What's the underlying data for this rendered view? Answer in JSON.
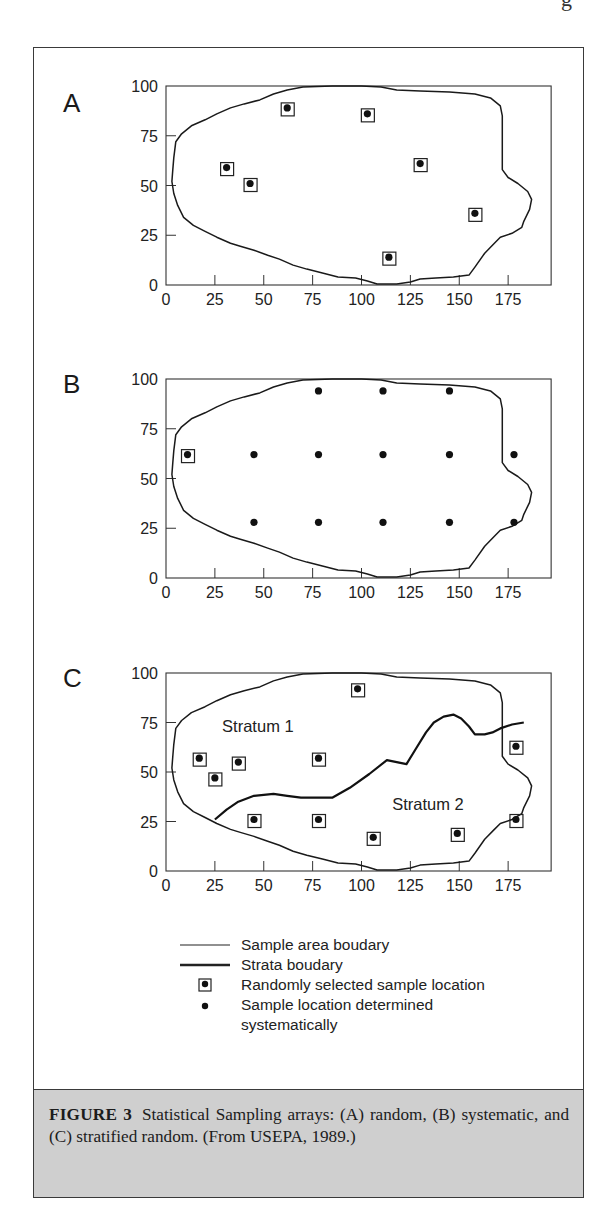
{
  "page": {
    "header_fragment": "g"
  },
  "figure": {
    "caption": {
      "label": "FIGURE 3",
      "text": "Statistical Sampling arrays: (A) random, (B) systematic, and (C) stratified random. (From USEPA, 1989.)"
    },
    "legend": [
      {
        "symbol": "thin-line",
        "label": "Sample area boudary"
      },
      {
        "symbol": "thick-line",
        "label": "Strata boudary"
      },
      {
        "symbol": "boxed-dot",
        "label": "Randomly selected sample location"
      },
      {
        "symbol": "dot",
        "label": "Sample location determined systematically"
      }
    ]
  },
  "chart_data": [
    {
      "type": "scatter",
      "panel_label": "A",
      "title": "Random sampling",
      "xlim": [
        0,
        197
      ],
      "ylim": [
        0,
        100
      ],
      "xticks": [
        0,
        25,
        50,
        75,
        100,
        125,
        150,
        175
      ],
      "yticks": [
        0,
        25,
        50,
        75,
        100
      ],
      "grid": false,
      "random_samples": [
        [
          31,
          59
        ],
        [
          43,
          51
        ],
        [
          62,
          89
        ],
        [
          103,
          86
        ],
        [
          130,
          61
        ],
        [
          158,
          36
        ],
        [
          114,
          14
        ]
      ],
      "systematic_samples": []
    },
    {
      "type": "scatter",
      "panel_label": "B",
      "title": "Systematic sampling",
      "xlim": [
        0,
        197
      ],
      "ylim": [
        0,
        100
      ],
      "xticks": [
        0,
        25,
        50,
        75,
        100,
        125,
        150,
        175
      ],
      "yticks": [
        0,
        25,
        50,
        75,
        100
      ],
      "grid": false,
      "random_samples": [
        [
          11,
          62
        ]
      ],
      "systematic_samples": [
        [
          78,
          94
        ],
        [
          111,
          94
        ],
        [
          145,
          94
        ],
        [
          11,
          62
        ],
        [
          45,
          62
        ],
        [
          78,
          62
        ],
        [
          111,
          62
        ],
        [
          145,
          62
        ],
        [
          178,
          62
        ],
        [
          45,
          28
        ],
        [
          78,
          28
        ],
        [
          111,
          28
        ],
        [
          145,
          28
        ],
        [
          178,
          28
        ]
      ]
    },
    {
      "type": "scatter",
      "panel_label": "C",
      "title": "Stratified random sampling",
      "xlim": [
        0,
        197
      ],
      "ylim": [
        0,
        100
      ],
      "xticks": [
        0,
        25,
        50,
        75,
        100,
        125,
        150,
        175
      ],
      "yticks": [
        0,
        25,
        50,
        75,
        100
      ],
      "grid": false,
      "annotations": [
        {
          "text": "Stratum 1",
          "x": 47,
          "y": 70
        },
        {
          "text": "Stratum 2",
          "x": 134,
          "y": 31
        }
      ],
      "random_samples": [
        [
          17,
          57
        ],
        [
          25,
          47
        ],
        [
          37,
          55
        ],
        [
          78,
          57
        ],
        [
          98,
          92
        ],
        [
          179,
          63
        ],
        [
          45,
          26
        ],
        [
          78,
          26
        ],
        [
          106,
          17
        ],
        [
          149,
          19
        ],
        [
          179,
          26
        ]
      ],
      "systematic_samples": [],
      "strata_boundary": [
        [
          25,
          26
        ],
        [
          31,
          31
        ],
        [
          37,
          35
        ],
        [
          45,
          38
        ],
        [
          55,
          39
        ],
        [
          62,
          38
        ],
        [
          69,
          37
        ],
        [
          85,
          37
        ],
        [
          94,
          42
        ],
        [
          104,
          49
        ],
        [
          113,
          56
        ],
        [
          118,
          55
        ],
        [
          123,
          54
        ],
        [
          128,
          62
        ],
        [
          133,
          70
        ],
        [
          137,
          75
        ],
        [
          142,
          78
        ],
        [
          147,
          79
        ],
        [
          151,
          77
        ],
        [
          155,
          73
        ],
        [
          158,
          69
        ],
        [
          163,
          69
        ],
        [
          167,
          70
        ],
        [
          171,
          72
        ],
        [
          177,
          74
        ],
        [
          183,
          75
        ]
      ]
    }
  ],
  "sample_area_boundary": [
    [
      5,
      72
    ],
    [
      8,
      76
    ],
    [
      13,
      80
    ],
    [
      20,
      83
    ],
    [
      26,
      86
    ],
    [
      33,
      89
    ],
    [
      40,
      91
    ],
    [
      48,
      93
    ],
    [
      55,
      96
    ],
    [
      62,
      98
    ],
    [
      70,
      99.5
    ],
    [
      85,
      100
    ],
    [
      100,
      100
    ],
    [
      110,
      99.5
    ],
    [
      118,
      98
    ],
    [
      130,
      97.5
    ],
    [
      145,
      97
    ],
    [
      158,
      96
    ],
    [
      166,
      94
    ],
    [
      171,
      90
    ],
    [
      172,
      85
    ],
    [
      172,
      70
    ],
    [
      172,
      58
    ],
    [
      175,
      54
    ],
    [
      180,
      51
    ],
    [
      185,
      47
    ],
    [
      187,
      43
    ],
    [
      186,
      38
    ],
    [
      183,
      32
    ],
    [
      182,
      29
    ],
    [
      177,
      26
    ],
    [
      171,
      24
    ],
    [
      168,
      21
    ],
    [
      163,
      16
    ],
    [
      158,
      9
    ],
    [
      155,
      5
    ],
    [
      147,
      4
    ],
    [
      138,
      3.5
    ],
    [
      130,
      3
    ],
    [
      125,
      1.5
    ],
    [
      118,
      0.5
    ],
    [
      108,
      0.5
    ],
    [
      103,
      2
    ],
    [
      97,
      3.5
    ],
    [
      88,
      4
    ],
    [
      80,
      6
    ],
    [
      72,
      8
    ],
    [
      65,
      10
    ],
    [
      58,
      13
    ],
    [
      52,
      15
    ],
    [
      45,
      17.5
    ],
    [
      38,
      19.5
    ],
    [
      33,
      21
    ],
    [
      26,
      24
    ],
    [
      20,
      27
    ],
    [
      14,
      30
    ],
    [
      9,
      34
    ],
    [
      6,
      40
    ],
    [
      4,
      46
    ],
    [
      3,
      52
    ],
    [
      3.5,
      58
    ],
    [
      4,
      64
    ],
    [
      5,
      72
    ]
  ]
}
